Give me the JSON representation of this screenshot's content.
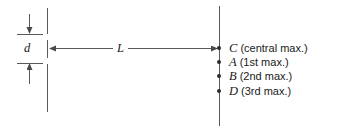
{
  "figure": {
    "type": "double-slit-interference-diagram",
    "background_color": "#ffffff",
    "stroke_color": "#5a5a5a",
    "text_color": "#1a1a1a",
    "dot_color": "#2b2b2b"
  },
  "dimensions": {
    "slit_separation_label": "d",
    "distance_label": "L"
  },
  "maxima": [
    {
      "point": "C",
      "desc": "(central max.)"
    },
    {
      "point": "A",
      "desc": "(1st max.)"
    },
    {
      "point": "B",
      "desc": "(2nd max.)"
    },
    {
      "point": "D",
      "desc": "(3rd max.)"
    }
  ]
}
